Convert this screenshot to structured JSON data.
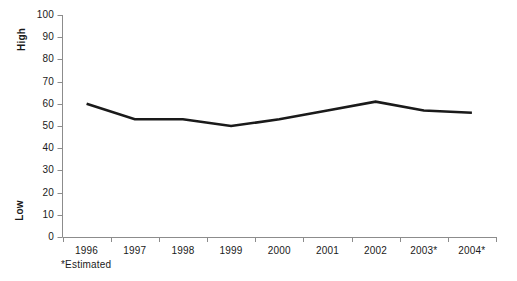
{
  "chart_data": {
    "type": "line",
    "title": "",
    "xlabel": "",
    "ylabel": "",
    "categories": [
      "1996",
      "1997",
      "1998",
      "1999",
      "2000",
      "2001",
      "2002",
      "2003*",
      "2004*"
    ],
    "values": [
      60,
      53,
      53,
      50,
      53,
      57,
      61,
      57,
      56
    ],
    "series": [
      {
        "name": "",
        "values": [
          60,
          53,
          53,
          50,
          53,
          57,
          61,
          57,
          56
        ]
      }
    ],
    "ylim": [
      0,
      100
    ],
    "yticks": [
      0,
      10,
      20,
      30,
      40,
      50,
      60,
      70,
      80,
      90,
      100
    ],
    "ytick_labels": [
      "0",
      "10",
      "20",
      "30",
      "40",
      "50",
      "60",
      "70",
      "80",
      "90",
      "100"
    ],
    "y_axis_end_labels": {
      "high": "High",
      "low": "Low"
    },
    "grid": false,
    "legend": "none",
    "footnote": "*Estimated",
    "line_color": "#1a1a1a",
    "axis_color": "#8c8c8c",
    "background_color": "#ffffff"
  }
}
